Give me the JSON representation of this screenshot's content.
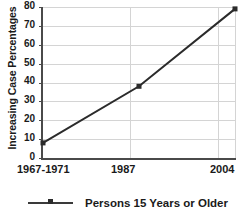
{
  "chart_data": {
    "type": "line",
    "title": "",
    "xlabel": "",
    "ylabel": "Increasing Case Percentages",
    "categories": [
      "1967-1971",
      "1987",
      "2004"
    ],
    "series": [
      {
        "name": "Persons 15 Years or Older",
        "values": [
          8,
          38,
          79
        ],
        "color": "#2b2b2b",
        "marker": "square"
      }
    ],
    "ylim": [
      0,
      80
    ],
    "ytick_step": 10,
    "yticks": [
      "80",
      "70",
      "60",
      "50",
      "40",
      "30",
      "20",
      "10",
      "0"
    ],
    "grid": true,
    "grid_color": "#d4d4d4",
    "axis_color": "#4a4a4a",
    "legend_position": "bottom"
  },
  "legend": {
    "entry_label": "Persons 15 Years or Older"
  }
}
